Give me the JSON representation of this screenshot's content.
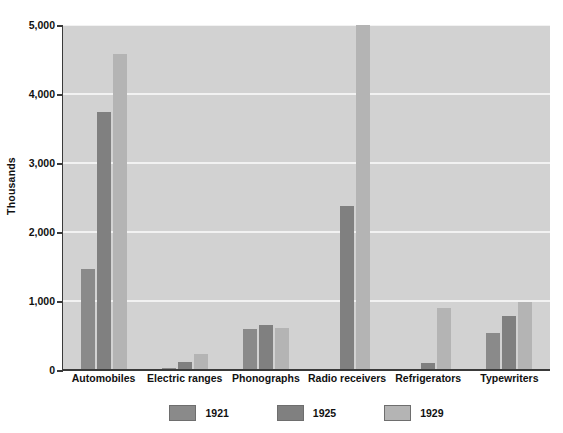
{
  "chart_data": {
    "type": "bar",
    "title": "",
    "subtitle": "",
    "xlabel": "",
    "ylabel": "Thousands",
    "ylim": [
      0,
      5000
    ],
    "yticks": [
      0,
      1000,
      2000,
      3000,
      4000,
      5000
    ],
    "ytick_labels": [
      "0",
      "1,000",
      "2,000",
      "3,000",
      "4,000",
      "5,000"
    ],
    "grid": true,
    "grid_axis": "y",
    "legend_position": "bottom-center",
    "categories": [
      "Automobiles",
      "Electric ranges",
      "Phonographs",
      "Radio receivers",
      "Refrigerators",
      "Typewriters"
    ],
    "series": [
      {
        "name": "1921",
        "color": "#8a8a8a",
        "values": [
          1468,
          30,
          596,
          0,
          5,
          533
        ]
      },
      {
        "name": "1925",
        "color": "#808080",
        "values": [
          3735,
          110,
          657,
          2370,
          98,
          789
        ]
      },
      {
        "name": "1929",
        "color": "#b4b4b4",
        "values": [
          4587,
          230,
          608,
          5000,
          903,
          979
        ]
      }
    ],
    "notes": {
      "radio_1929_clipped": "Radio receivers 1929 bar reaches the top of the 5,000 axis",
      "radio_1921_zero": "No visible 1921 bar for Radio receivers"
    }
  },
  "axis": {
    "y_title": "Thousands"
  },
  "legend": {
    "items": [
      {
        "label": "1921",
        "color": "#8a8a8a"
      },
      {
        "label": "1925",
        "color": "#808080"
      },
      {
        "label": "1929",
        "color": "#b4b4b4"
      }
    ]
  },
  "style": {
    "plot_background": "#d2d2d2",
    "page_background": "#ffffff",
    "gridline_color": "#f2f2f2",
    "axis_color": "#3a3a3a",
    "text_color": "#111111"
  }
}
